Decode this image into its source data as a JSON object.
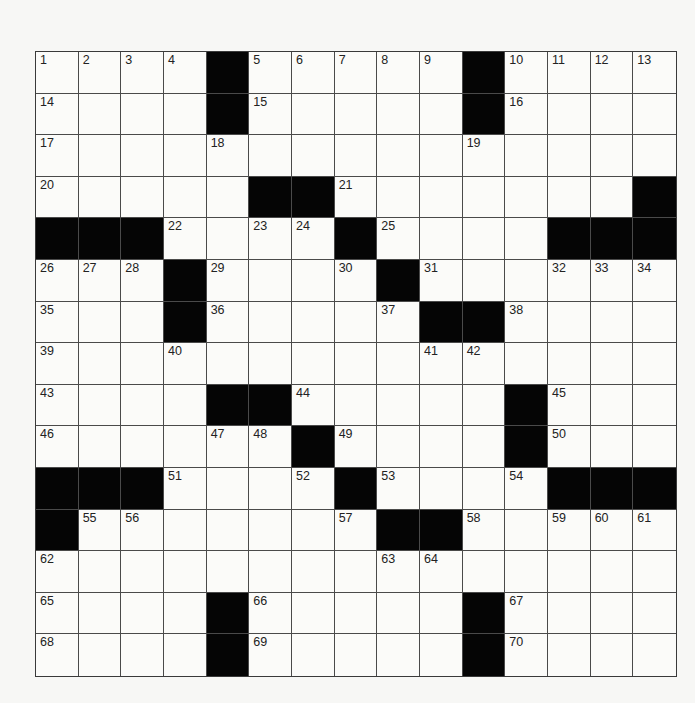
{
  "puzzle": {
    "rows": 15,
    "cols": 15,
    "grid": [
      "....#.....#....",
      "....#.....#....",
      "...............",
      ".....##.......#",
      "###....#....###",
      "...#....#......",
      "...#.....##....",
      "...............",
      "....##.....#...",
      "......#....#...",
      "###....#....###",
      "#.......##.....",
      "...............",
      "....#.....#....",
      "....#.....#...."
    ],
    "numbers": [
      {
        "r": 0,
        "c": 0,
        "n": "1"
      },
      {
        "r": 0,
        "c": 1,
        "n": "2"
      },
      {
        "r": 0,
        "c": 2,
        "n": "3"
      },
      {
        "r": 0,
        "c": 3,
        "n": "4"
      },
      {
        "r": 0,
        "c": 5,
        "n": "5"
      },
      {
        "r": 0,
        "c": 6,
        "n": "6"
      },
      {
        "r": 0,
        "c": 7,
        "n": "7"
      },
      {
        "r": 0,
        "c": 8,
        "n": "8"
      },
      {
        "r": 0,
        "c": 9,
        "n": "9"
      },
      {
        "r": 0,
        "c": 11,
        "n": "10"
      },
      {
        "r": 0,
        "c": 12,
        "n": "11"
      },
      {
        "r": 0,
        "c": 13,
        "n": "12"
      },
      {
        "r": 0,
        "c": 14,
        "n": "13"
      },
      {
        "r": 1,
        "c": 0,
        "n": "14"
      },
      {
        "r": 1,
        "c": 5,
        "n": "15"
      },
      {
        "r": 1,
        "c": 11,
        "n": "16"
      },
      {
        "r": 2,
        "c": 0,
        "n": "17"
      },
      {
        "r": 2,
        "c": 4,
        "n": "18"
      },
      {
        "r": 2,
        "c": 10,
        "n": "19"
      },
      {
        "r": 3,
        "c": 0,
        "n": "20"
      },
      {
        "r": 3,
        "c": 7,
        "n": "21"
      },
      {
        "r": 4,
        "c": 3,
        "n": "22"
      },
      {
        "r": 4,
        "c": 5,
        "n": "23"
      },
      {
        "r": 4,
        "c": 6,
        "n": "24"
      },
      {
        "r": 4,
        "c": 8,
        "n": "25"
      },
      {
        "r": 5,
        "c": 0,
        "n": "26"
      },
      {
        "r": 5,
        "c": 1,
        "n": "27"
      },
      {
        "r": 5,
        "c": 2,
        "n": "28"
      },
      {
        "r": 5,
        "c": 4,
        "n": "29"
      },
      {
        "r": 5,
        "c": 7,
        "n": "30"
      },
      {
        "r": 5,
        "c": 9,
        "n": "31"
      },
      {
        "r": 5,
        "c": 12,
        "n": "32"
      },
      {
        "r": 5,
        "c": 13,
        "n": "33"
      },
      {
        "r": 5,
        "c": 14,
        "n": "34"
      },
      {
        "r": 6,
        "c": 0,
        "n": "35"
      },
      {
        "r": 6,
        "c": 4,
        "n": "36"
      },
      {
        "r": 6,
        "c": 8,
        "n": "37"
      },
      {
        "r": 6,
        "c": 11,
        "n": "38"
      },
      {
        "r": 7,
        "c": 0,
        "n": "39"
      },
      {
        "r": 7,
        "c": 3,
        "n": "40"
      },
      {
        "r": 7,
        "c": 9,
        "n": "41"
      },
      {
        "r": 7,
        "c": 10,
        "n": "42"
      },
      {
        "r": 8,
        "c": 0,
        "n": "43"
      },
      {
        "r": 8,
        "c": 6,
        "n": "44"
      },
      {
        "r": 8,
        "c": 12,
        "n": "45"
      },
      {
        "r": 9,
        "c": 0,
        "n": "46"
      },
      {
        "r": 9,
        "c": 4,
        "n": "47"
      },
      {
        "r": 9,
        "c": 5,
        "n": "48"
      },
      {
        "r": 9,
        "c": 7,
        "n": "49"
      },
      {
        "r": 9,
        "c": 12,
        "n": "50"
      },
      {
        "r": 10,
        "c": 3,
        "n": "51"
      },
      {
        "r": 10,
        "c": 6,
        "n": "52"
      },
      {
        "r": 10,
        "c": 8,
        "n": "53"
      },
      {
        "r": 10,
        "c": 11,
        "n": "54"
      },
      {
        "r": 11,
        "c": 1,
        "n": "55"
      },
      {
        "r": 11,
        "c": 2,
        "n": "56"
      },
      {
        "r": 11,
        "c": 7,
        "n": "57"
      },
      {
        "r": 11,
        "c": 10,
        "n": "58"
      },
      {
        "r": 11,
        "c": 12,
        "n": "59"
      },
      {
        "r": 11,
        "c": 13,
        "n": "60"
      },
      {
        "r": 11,
        "c": 14,
        "n": "61"
      },
      {
        "r": 12,
        "c": 0,
        "n": "62"
      },
      {
        "r": 12,
        "c": 8,
        "n": "63"
      },
      {
        "r": 12,
        "c": 9,
        "n": "64"
      },
      {
        "r": 13,
        "c": 0,
        "n": "65"
      },
      {
        "r": 13,
        "c": 5,
        "n": "66"
      },
      {
        "r": 13,
        "c": 11,
        "n": "67"
      },
      {
        "r": 14,
        "c": 0,
        "n": "68"
      },
      {
        "r": 14,
        "c": 5,
        "n": "69"
      },
      {
        "r": 14,
        "c": 11,
        "n": "70"
      }
    ]
  }
}
